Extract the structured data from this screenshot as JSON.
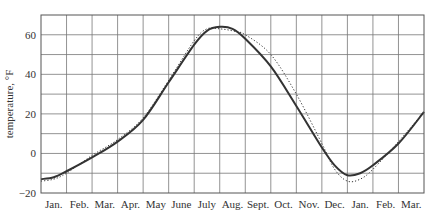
{
  "chart_data": {
    "type": "line",
    "title": "",
    "xlabel": "",
    "ylabel": "temperature, °F",
    "ylim": [
      -20,
      70
    ],
    "yticks": [
      -20,
      0,
      20,
      40,
      60
    ],
    "grid": true,
    "grid_y_step": 10,
    "categories": [
      "Jan.",
      "Feb.",
      "Mar.",
      "Apr.",
      "May",
      "June",
      "July",
      "Aug.",
      "Sept.",
      "Oct.",
      "Nov.",
      "Dec.",
      "Jan.",
      "Feb.",
      "Mar."
    ],
    "series": [
      {
        "name": "fitted curve",
        "style": "solid",
        "x": [
          0,
          0.5,
          1,
          2,
          3,
          4,
          5,
          6,
          6.5,
          7,
          7.5,
          8,
          9,
          10,
          11,
          11.5,
          12,
          12.5,
          13,
          14,
          15
        ],
        "values": [
          -13,
          -12,
          -9,
          -2,
          6,
          17,
          36,
          55,
          62,
          64,
          63,
          58,
          44,
          24,
          3,
          -6,
          -11,
          -10,
          -6,
          5,
          21
        ]
      },
      {
        "name": "observed",
        "style": "dotted",
        "x": [
          0,
          0.5,
          1,
          2,
          3,
          4,
          5,
          6,
          6.5,
          7,
          7.5,
          8,
          9,
          10,
          11,
          11.5,
          12,
          12.5,
          13,
          14,
          15
        ],
        "values": [
          -14,
          -13,
          -10,
          -1,
          7,
          18,
          37,
          57,
          63,
          63,
          62,
          60,
          50,
          30,
          5,
          -8,
          -14,
          -13,
          -8,
          6,
          21
        ]
      }
    ]
  },
  "colors": {
    "line": "#333333",
    "grid": "#777777",
    "text": "#333333"
  }
}
